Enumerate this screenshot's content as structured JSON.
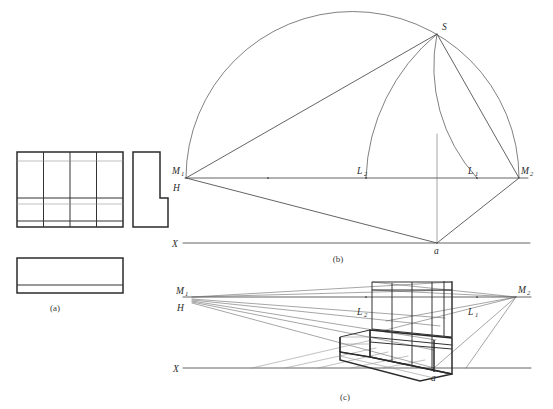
{
  "figure": {
    "background_color": "#ffffff",
    "line_color": "#3c3c3c",
    "width": 553,
    "height": 409
  },
  "panels": [
    {
      "id": "a",
      "caption": "(a)",
      "caption_x": 61,
      "caption_y": 309,
      "description": "Orthographic views: front elevation with grid divisions, L-shaped side elevation, and plan rectangle"
    },
    {
      "id": "b",
      "caption": "(b)",
      "caption_x": 338,
      "caption_y": 261,
      "description": "Measuring point construction with semicircle on M1-M2, station point S, and ground line X"
    },
    {
      "id": "c",
      "caption": "(c)",
      "caption_x": 345,
      "caption_y": 399,
      "description": "Resulting two-point perspective drawing of the stepped block"
    }
  ],
  "labels": {
    "panel_b": [
      {
        "name": "M1",
        "base": "M",
        "sub": "1",
        "x": 175,
        "y": 172
      },
      {
        "name": "H",
        "base": "H",
        "sub": "",
        "x": 176,
        "y": 189
      },
      {
        "name": "L2",
        "base": "L",
        "sub": "2",
        "x": 358,
        "y": 172
      },
      {
        "name": "L1",
        "base": "L",
        "sub": "1",
        "x": 470,
        "y": 172
      },
      {
        "name": "M2",
        "base": "M",
        "sub": "2",
        "x": 523,
        "y": 172
      },
      {
        "name": "S",
        "base": "S",
        "sub": "",
        "x": 440,
        "y": 29
      },
      {
        "name": "X",
        "base": "X",
        "sub": "",
        "x": 177,
        "y": 246
      },
      {
        "name": "a",
        "base": "a",
        "sub": "",
        "x": 434,
        "y": 254
      }
    ],
    "panel_c": [
      {
        "name": "M1",
        "base": "M",
        "sub": "1",
        "x": 177,
        "y": 292
      },
      {
        "name": "H",
        "base": "H",
        "sub": "",
        "x": 178,
        "y": 311
      },
      {
        "name": "L2",
        "base": "L",
        "sub": "2",
        "x": 355,
        "y": 313
      },
      {
        "name": "L1",
        "base": "L",
        "sub": "1",
        "x": 470,
        "y": 313
      },
      {
        "name": "M2",
        "base": "M",
        "sub": "2",
        "x": 521,
        "y": 291
      },
      {
        "name": "X",
        "base": "X",
        "sub": "",
        "x": 178,
        "y": 371
      },
      {
        "name": "a",
        "base": "a",
        "sub": "",
        "x": 434,
        "y": 381
      }
    ]
  },
  "geometry": {
    "panel_b": {
      "horizon_line": {
        "x1": 185,
        "y1": 178,
        "x2": 528,
        "y2": 178
      },
      "ground_line": {
        "x1": 183,
        "y1": 243,
        "x2": 530,
        "y2": 243
      },
      "M1": {
        "x": 186,
        "y": 178
      },
      "M2": {
        "x": 519,
        "y": 178
      },
      "L1": {
        "x": 477,
        "y": 178
      },
      "L2": {
        "x": 366,
        "y": 178
      },
      "S": {
        "x": 437,
        "y": 34
      },
      "a": {
        "x": 437,
        "y": 243
      },
      "semicircle_radius": 166.5,
      "semicircle_center_x": 352.5
    },
    "panel_c": {
      "horizon_line": {
        "x1": 183,
        "y1": 297,
        "x2": 531,
        "y2": 297
      },
      "ground_line": {
        "x1": 183,
        "y1": 368,
        "x2": 531,
        "y2": 368
      },
      "M1": {
        "x": 192,
        "y": 297
      },
      "M2": {
        "x": 516,
        "y": 297
      },
      "L1": {
        "x": 477,
        "y": 297
      },
      "L2": {
        "x": 366,
        "y": 297
      },
      "a": {
        "x": 434,
        "y": 368
      }
    }
  }
}
